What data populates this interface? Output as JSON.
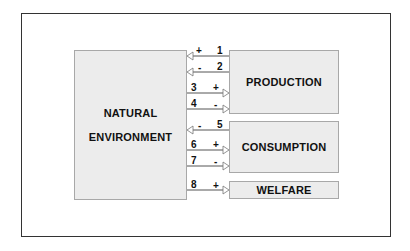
{
  "diagram": {
    "frame": {
      "border_color": "#333333"
    },
    "boxes": {
      "natural_environment": {
        "line1": "NATURAL",
        "line2": "ENVIRONMENT"
      },
      "production": {
        "label": "PRODUCTION"
      },
      "consumption": {
        "label": "CONSUMPTION"
      },
      "welfare": {
        "label": "WELFARE"
      }
    },
    "arrows": [
      {
        "number": "1",
        "sign": "+",
        "from": "PRODUCTION",
        "to": "NATURAL ENVIRONMENT"
      },
      {
        "number": "2",
        "sign": "-",
        "from": "PRODUCTION",
        "to": "NATURAL ENVIRONMENT"
      },
      {
        "number": "3",
        "sign": "+",
        "from": "NATURAL ENVIRONMENT",
        "to": "PRODUCTION"
      },
      {
        "number": "4",
        "sign": "-",
        "from": "NATURAL ENVIRONMENT",
        "to": "PRODUCTION"
      },
      {
        "number": "5",
        "sign": "-",
        "from": "CONSUMPTION",
        "to": "NATURAL ENVIRONMENT"
      },
      {
        "number": "6",
        "sign": "+",
        "from": "NATURAL ENVIRONMENT",
        "to": "CONSUMPTION"
      },
      {
        "number": "7",
        "sign": "-",
        "from": "NATURAL ENVIRONMENT",
        "to": "CONSUMPTION"
      },
      {
        "number": "8",
        "sign": "+",
        "from": "NATURAL ENVIRONMENT",
        "to": "WELFARE"
      }
    ],
    "colors": {
      "box_fill": "#ececec",
      "box_border": "#a8a8a8",
      "line": "#555555",
      "text": "#111111"
    }
  }
}
